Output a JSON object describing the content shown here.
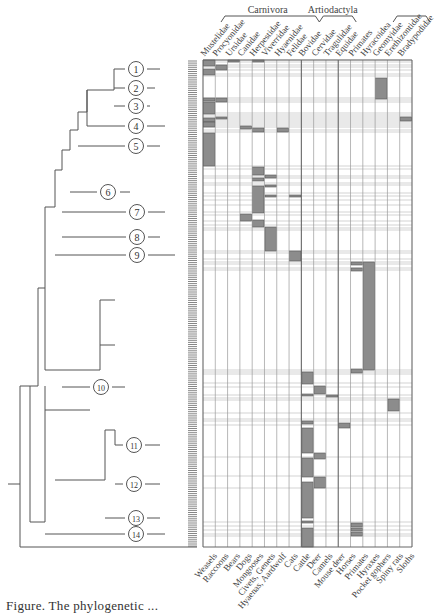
{
  "figure": {
    "groups": [
      {
        "label": "Carnivora",
        "from_col": 0,
        "to_col": 7
      },
      {
        "label": "Artiodactyla",
        "from_col": 8,
        "to_col": 10
      },
      {
        "label": "",
        "from_col": 14,
        "to_col": 16
      }
    ],
    "column_headers": [
      "Mustelidae",
      "Procyonidae",
      "Ursidae",
      "Canidae",
      "Herpestidae",
      "Viverridae",
      "Hyaenidae",
      "Felidae",
      "Bovidae",
      "Cervidae",
      "Tragulidae",
      "Equidae",
      "Primates",
      "Hyracoidea",
      "Geomyidae",
      "Erethizontidae",
      "Bradypodidae"
    ],
    "column_footers": [
      "Weasels",
      "Raccoons",
      "Bears",
      "Dogs",
      "Mongooses",
      "Civets, Genets",
      "Hyaenas, Aardwolf",
      "Cats",
      "Cattle",
      "Deer",
      "Camels",
      "Mouse deer",
      "Horses",
      "Primates",
      "Hyraxes",
      "Pocket gophers",
      "Spiny rats",
      "Sloths"
    ],
    "clade_labels": [
      "1",
      "2",
      "3",
      "4",
      "5",
      "6",
      "7",
      "8",
      "9",
      "10",
      "11",
      "12",
      "13",
      "14"
    ],
    "caption": "Figure. The phylogenetic ..."
  },
  "colors": {
    "line": "#555555",
    "fill": "#8c8c8c",
    "grid": "#9a9a9a",
    "gridLight": "#c8c8c8"
  },
  "matrix": {
    "x0": 203,
    "x1": 412,
    "y0": 60,
    "y1": 547,
    "cells": [
      {
        "col": 0,
        "y": 60,
        "h": 6
      },
      {
        "col": 0,
        "y": 69,
        "h": 6
      },
      {
        "col": 0,
        "y": 98,
        "h": 3
      },
      {
        "col": 0,
        "y": 102,
        "h": 12
      },
      {
        "col": 0,
        "y": 118,
        "h": 4
      },
      {
        "col": 0,
        "y": 122,
        "h": 5
      },
      {
        "col": 0,
        "y": 133,
        "h": 33
      },
      {
        "col": 1,
        "y": 65,
        "h": 5
      },
      {
        "col": 1,
        "y": 98,
        "h": 4
      },
      {
        "col": 1,
        "y": 117,
        "h": 2
      },
      {
        "col": 2,
        "y": 60,
        "h": 2
      },
      {
        "col": 4,
        "y": 60,
        "h": 2
      },
      {
        "col": 4,
        "y": 128,
        "h": 4
      },
      {
        "col": 3,
        "y": 126,
        "h": 3
      },
      {
        "col": 3,
        "y": 214,
        "h": 7
      },
      {
        "col": 4,
        "y": 167,
        "h": 8
      },
      {
        "col": 4,
        "y": 178,
        "h": 3
      },
      {
        "col": 4,
        "y": 186,
        "h": 27
      },
      {
        "col": 4,
        "y": 220,
        "h": 7
      },
      {
        "col": 5,
        "y": 175,
        "h": 3
      },
      {
        "col": 5,
        "y": 185,
        "h": 2
      },
      {
        "col": 5,
        "y": 195,
        "h": 2
      },
      {
        "col": 5,
        "y": 227,
        "h": 24
      },
      {
        "col": 6,
        "y": 128,
        "h": 4
      },
      {
        "col": 7,
        "y": 195,
        "h": 2
      },
      {
        "col": 7,
        "y": 251,
        "h": 10
      },
      {
        "col": 12,
        "y": 262,
        "h": 3
      },
      {
        "col": 12,
        "y": 268,
        "h": 3
      },
      {
        "col": 12,
        "y": 369,
        "h": 4
      },
      {
        "col": 13,
        "y": 262,
        "h": 108
      },
      {
        "col": 8,
        "y": 372,
        "h": 12
      },
      {
        "col": 8,
        "y": 394,
        "h": 2
      },
      {
        "col": 9,
        "y": 386,
        "h": 8
      },
      {
        "col": 10,
        "y": 395,
        "h": 2
      },
      {
        "col": 15,
        "y": 399,
        "h": 12
      },
      {
        "col": 14,
        "y": 78,
        "h": 21
      },
      {
        "col": 16,
        "y": 117,
        "h": 4
      },
      {
        "col": 8,
        "y": 421,
        "h": 3
      },
      {
        "col": 8,
        "y": 428,
        "h": 25
      },
      {
        "col": 8,
        "y": 458,
        "h": 19
      },
      {
        "col": 8,
        "y": 482,
        "h": 36
      },
      {
        "col": 8,
        "y": 521,
        "h": 2
      },
      {
        "col": 8,
        "y": 528,
        "h": 19
      },
      {
        "col": 9,
        "y": 453,
        "h": 6
      },
      {
        "col": 9,
        "y": 477,
        "h": 11
      },
      {
        "col": 11,
        "y": 423,
        "h": 5
      },
      {
        "col": 12,
        "y": 523,
        "h": 4
      },
      {
        "col": 12,
        "y": 528,
        "h": 3
      },
      {
        "col": 12,
        "y": 532,
        "h": 4
      }
    ],
    "row_lines": [
      60,
      62,
      65,
      67,
      70,
      74,
      76,
      98,
      100,
      102,
      113,
      115,
      117,
      119,
      121,
      123,
      125,
      127,
      130,
      132,
      166,
      169,
      176,
      178,
      183,
      185,
      193,
      196,
      200,
      205,
      212,
      215,
      221,
      225,
      228,
      230,
      251,
      253,
      259,
      262,
      264,
      268,
      270,
      370,
      372,
      374,
      383,
      387,
      395,
      398,
      400,
      413,
      419,
      421,
      425,
      457,
      476,
      488,
      522,
      526,
      530,
      534,
      536
    ]
  },
  "tree": {
    "circles": [
      {
        "n": "1",
        "x": 136,
        "y": 69
      },
      {
        "n": "2",
        "x": 136,
        "y": 88
      },
      {
        "n": "3",
        "x": 136,
        "y": 106
      },
      {
        "n": "4",
        "x": 136,
        "y": 126
      },
      {
        "n": "5",
        "x": 136,
        "y": 146
      },
      {
        "n": "6",
        "x": 108,
        "y": 192
      },
      {
        "n": "7",
        "x": 137,
        "y": 212
      },
      {
        "n": "8",
        "x": 137,
        "y": 237
      },
      {
        "n": "9",
        "x": 137,
        "y": 255
      },
      {
        "n": "10",
        "x": 101,
        "y": 387
      },
      {
        "n": "11",
        "x": 134,
        "y": 445
      },
      {
        "n": "12",
        "x": 134,
        "y": 484
      },
      {
        "n": "13",
        "x": 136,
        "y": 518
      },
      {
        "n": "14",
        "x": 136,
        "y": 534
      }
    ]
  }
}
